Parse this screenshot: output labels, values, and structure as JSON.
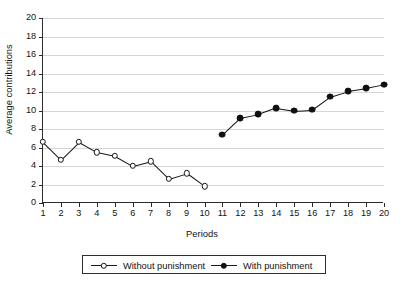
{
  "chart_data": {
    "type": "line",
    "title": "",
    "xlabel": "Periods",
    "ylabel": "Average contributions",
    "xlim": [
      1,
      20
    ],
    "ylim": [
      0,
      20
    ],
    "ytick_step": 2,
    "grid": true,
    "legend_position": "below-center",
    "x": [
      1,
      2,
      3,
      4,
      5,
      6,
      7,
      8,
      9,
      10,
      11,
      12,
      13,
      14,
      15,
      16,
      17,
      18,
      19,
      20
    ],
    "xtick_labels": [
      "1",
      "2",
      "3",
      "4",
      "5",
      "6",
      "7",
      "8",
      "9",
      "10",
      "11",
      "12",
      "13",
      "14",
      "15",
      "16",
      "17",
      "18",
      "19",
      "20"
    ],
    "ytick_labels": [
      "0",
      "2",
      "4",
      "6",
      "8",
      "10",
      "12",
      "14",
      "16",
      "18",
      "20"
    ],
    "series": [
      {
        "name": "Without punishment",
        "marker": "open-circle",
        "color": "#141414",
        "x": [
          1,
          2,
          3,
          4,
          5,
          6,
          7,
          8,
          9,
          10
        ],
        "values": [
          6.6,
          4.7,
          6.6,
          5.5,
          5.1,
          4.0,
          4.5,
          2.6,
          3.2,
          1.8
        ]
      },
      {
        "name": "With punishment",
        "marker": "filled-circle",
        "color": "#101010",
        "x": [
          11,
          12,
          13,
          14,
          15,
          16,
          17,
          18,
          19,
          20
        ],
        "values": [
          7.4,
          9.2,
          9.6,
          10.3,
          10.0,
          10.1,
          11.5,
          12.1,
          12.4,
          12.8
        ]
      }
    ]
  },
  "legend": {
    "entries": [
      {
        "label": "Without punishment",
        "marker": "open-circle"
      },
      {
        "label": "With punishment",
        "marker": "filled-circle"
      }
    ]
  }
}
